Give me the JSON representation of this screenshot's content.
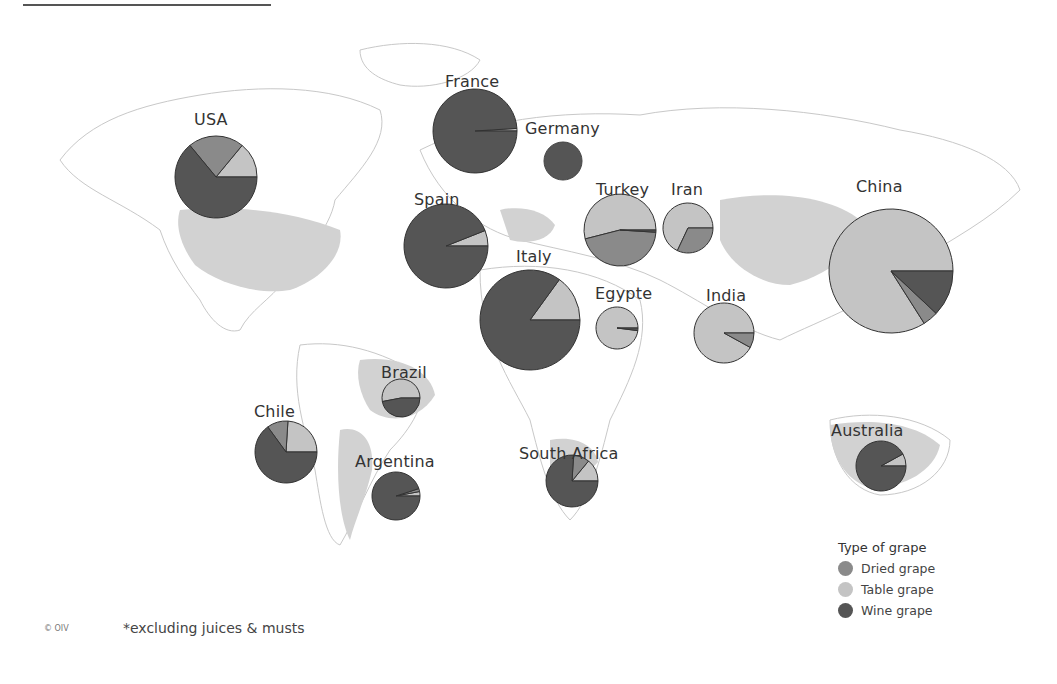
{
  "colors": {
    "dried": "#8a8a8a",
    "table": "#c4c4c4",
    "wine": "#555555",
    "highlight_country": "#d2d2d2",
    "outline": "#bfbfbf"
  },
  "legend": {
    "title": "Type of grape",
    "items": [
      {
        "label": "Dried grape",
        "key": "dried"
      },
      {
        "label": "Table grape",
        "key": "table"
      },
      {
        "label": "Wine grape",
        "key": "wine"
      }
    ]
  },
  "footnote": "*excluding juices & musts",
  "copyright": "© OIV",
  "chart_data": {
    "type": "pie",
    "legend_position": "bottom-right",
    "series_names": [
      "Dried grape",
      "Table grape",
      "Wine grape"
    ],
    "countries": [
      {
        "name": "USA",
        "cx": 216,
        "cy": 177,
        "r": 41,
        "label_x": 194,
        "label_y": 110,
        "dried": 22,
        "table": 14,
        "wine": 64
      },
      {
        "name": "France",
        "cx": 475,
        "cy": 131,
        "r": 42,
        "label_x": 445,
        "label_y": 72,
        "dried": 0,
        "table": 1,
        "wine": 99
      },
      {
        "name": "Germany",
        "cx": 563,
        "cy": 161,
        "r": 19,
        "label_x": 525,
        "label_y": 119,
        "dried": 0,
        "table": 0,
        "wine": 100
      },
      {
        "name": "Spain",
        "cx": 446,
        "cy": 246,
        "r": 42,
        "label_x": 414,
        "label_y": 190,
        "dried": 0,
        "table": 6,
        "wine": 94
      },
      {
        "name": "Italy",
        "cx": 530,
        "cy": 320,
        "r": 50,
        "label_x": 516,
        "label_y": 247,
        "dried": 0,
        "table": 15,
        "wine": 85
      },
      {
        "name": "Turkey",
        "cx": 620,
        "cy": 230,
        "r": 36,
        "label_x": 596,
        "label_y": 180,
        "dried": 45,
        "table": 54,
        "wine": 1
      },
      {
        "name": "Iran",
        "cx": 688,
        "cy": 228,
        "r": 25,
        "label_x": 671,
        "label_y": 180,
        "dried": 32,
        "table": 68,
        "wine": 0
      },
      {
        "name": "China",
        "cx": 891,
        "cy": 271,
        "r": 62,
        "label_x": 856,
        "label_y": 177,
        "dried": 4,
        "table": 84,
        "wine": 12
      },
      {
        "name": "Egypte",
        "cx": 617,
        "cy": 328,
        "r": 21,
        "label_x": 595,
        "label_y": 284,
        "dried": 0,
        "table": 98,
        "wine": 2
      },
      {
        "name": "India",
        "cx": 724,
        "cy": 333,
        "r": 30,
        "label_x": 706,
        "label_y": 286,
        "dried": 8,
        "table": 92,
        "wine": 0
      },
      {
        "name": "Brazil",
        "cx": 401,
        "cy": 398,
        "r": 19,
        "label_x": 381,
        "label_y": 363,
        "dried": 0,
        "table": 53,
        "wine": 47
      },
      {
        "name": "Chile",
        "cx": 286,
        "cy": 452,
        "r": 31,
        "label_x": 254,
        "label_y": 402,
        "dried": 11,
        "table": 24,
        "wine": 65
      },
      {
        "name": "Argentina",
        "cx": 396,
        "cy": 496,
        "r": 24,
        "label_x": 355,
        "label_y": 452,
        "dried": 2,
        "table": 3,
        "wine": 95
      },
      {
        "name": "South Africa",
        "cx": 572,
        "cy": 481,
        "r": 26,
        "label_x": 519,
        "label_y": 444,
        "dried": 10,
        "table": 14,
        "wine": 76
      },
      {
        "name": "Australia",
        "cx": 881,
        "cy": 466,
        "r": 25,
        "label_x": 831,
        "label_y": 421,
        "dried": 0,
        "table": 8,
        "wine": 92
      }
    ]
  }
}
